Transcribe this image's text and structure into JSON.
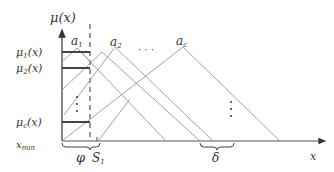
{
  "diagram": {
    "y_axis_label": "μ(x)",
    "x_axis_label": "x",
    "membership_labels": [
      {
        "name": "μ1",
        "main": "μ",
        "sub": "1",
        "tail": "(x)"
      },
      {
        "name": "μ2",
        "main": "μ",
        "sub": "2",
        "tail": "(x)"
      },
      {
        "name": "μc",
        "main": "μ",
        "sub": "c",
        "tail": "(x)"
      }
    ],
    "peak_labels": [
      {
        "main": "a",
        "sub": "1"
      },
      {
        "main": "a",
        "sub": "2"
      },
      {
        "main": "a",
        "sub": "c"
      }
    ],
    "peak_ellipsis": "· · ·",
    "vertical_ellipsis": "⋮",
    "x_min_label": {
      "main": "x",
      "sub": "min"
    },
    "phi_label": "φ",
    "s1_label": {
      "main": "S",
      "sub": "1"
    },
    "delta_label": "δ",
    "colors": {
      "axis": "#444444",
      "line": "#888888",
      "bar": "#444444"
    }
  }
}
